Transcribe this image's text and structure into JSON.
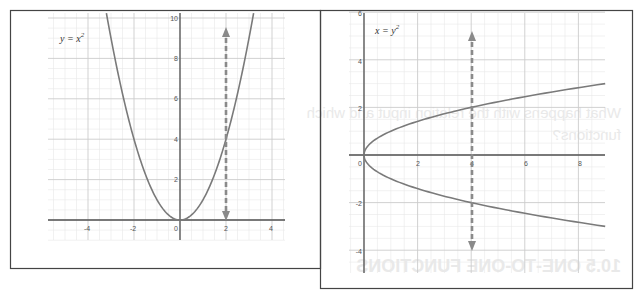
{
  "chart_data": [
    {
      "type": "line",
      "title": "y = x^2",
      "label": "y = x²",
      "function": "y = x^2",
      "xlim": [
        -5.5,
        5.8
      ],
      "ylim": [
        -1.4,
        10.4
      ],
      "x_ticks": [
        -4,
        -2,
        0,
        2,
        4
      ],
      "x_tick_labels": [
        "-4",
        "-2",
        "0",
        "2",
        "4"
      ],
      "y_ticks": [
        2,
        4,
        6,
        8,
        10
      ],
      "y_tick_labels": [
        "2",
        "4",
        "6",
        "8",
        "10"
      ],
      "grid": true,
      "series": [
        {
          "name": "y = x^2",
          "x": [
            -3.2,
            -3,
            -2.5,
            -2,
            -1.5,
            -1,
            -0.5,
            0,
            0.5,
            1,
            1.5,
            2,
            2.5,
            3,
            3.2
          ],
          "y": [
            10.24,
            9,
            6.25,
            4,
            2.25,
            1,
            0.25,
            0,
            0.25,
            1,
            2.25,
            4,
            6.25,
            9,
            10.24
          ]
        }
      ],
      "annotations": [
        {
          "type": "double-arrow-dashed",
          "x": 2,
          "y_from": 0,
          "y_to": 9.5,
          "note": "vertical line test at x = 2 crosses once"
        }
      ],
      "legend": "none"
    },
    {
      "type": "line",
      "title": "x = y^2",
      "label": "x = y²",
      "function": "x = y^2",
      "xlim": [
        -0.3,
        8.8
      ],
      "ylim": [
        -5,
        6
      ],
      "x_ticks": [
        0,
        2,
        4,
        6,
        8
      ],
      "x_tick_labels": [
        "0",
        "2",
        "4",
        "6",
        "8"
      ],
      "y_ticks": [
        -4,
        -2,
        2,
        4,
        6
      ],
      "y_tick_labels": [
        "-4",
        "-2",
        "2",
        "4",
        "6"
      ],
      "grid": true,
      "series": [
        {
          "name": "upper branch y = √x",
          "x": [
            0,
            0.25,
            1,
            2,
            3,
            4,
            5,
            6,
            7,
            8,
            9
          ],
          "y": [
            0,
            0.5,
            1,
            1.414,
            1.732,
            2,
            2.236,
            2.449,
            2.646,
            2.828,
            3
          ]
        },
        {
          "name": "lower branch y = -√x",
          "x": [
            0,
            0.25,
            1,
            2,
            3,
            4,
            5,
            6,
            7,
            8,
            9
          ],
          "y": [
            0,
            -0.5,
            -1,
            -1.414,
            -1.732,
            -2,
            -2.236,
            -2.449,
            -2.646,
            -2.828,
            -3
          ]
        }
      ],
      "annotations": [
        {
          "type": "double-arrow-dashed",
          "x": 4,
          "y_from": -4,
          "y_to": 5,
          "note": "vertical line test at x = 4 crosses twice (y = 2 and y = -2)"
        }
      ],
      "legend": "none"
    }
  ],
  "panels": {
    "left": {
      "equation_var_left": "y",
      "equation_eq": " = ",
      "equation_var_right": "x",
      "equation_exp": "2",
      "x_labels": [
        "-4",
        "-2",
        "0",
        "2",
        "4"
      ],
      "y_labels": [
        "2",
        "4",
        "6",
        "8",
        "10"
      ]
    },
    "right": {
      "equation_var_left": "x",
      "equation_eq": " = ",
      "equation_var_right": "y",
      "equation_exp": "2",
      "x_labels": [
        "0",
        "2",
        "4",
        "6",
        "8"
      ],
      "y_labels": [
        "6",
        "4",
        "2",
        "-2",
        "-4"
      ]
    }
  },
  "bleed_through_text": {
    "line1": "What happens with the relation input and which",
    "line2": "functions?",
    "heading": "10.5 ONE-TO-ONE FUNCTIONS"
  },
  "colors": {
    "curve": "#7a7a7a",
    "axis": "#555555",
    "grid_major": "#c9c9c9",
    "grid_minor": "#e6e6e6",
    "arrow": "#8a8a8a",
    "frame": "#444444"
  }
}
